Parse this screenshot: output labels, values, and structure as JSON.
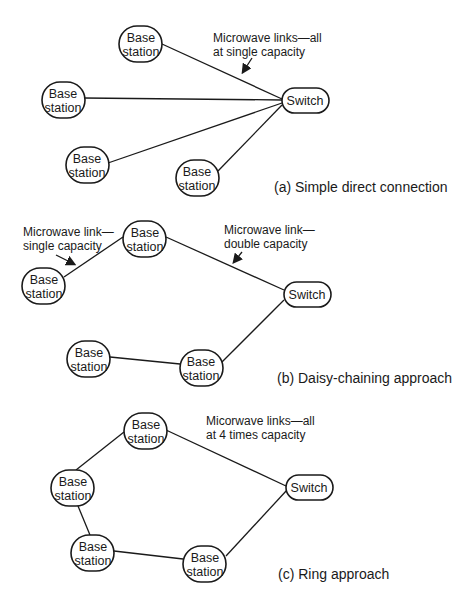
{
  "node_labels": {
    "base_line1": "Base",
    "base_line2": "station",
    "switch": "Switch"
  },
  "panels": [
    {
      "id": "a",
      "caption": "(a) Simple direct connection",
      "annotation": [
        "Microwave links—all",
        "at single capacity"
      ]
    },
    {
      "id": "b",
      "caption": "(b) Daisy-chaining approach",
      "annotation_left": [
        "Microwave link—",
        "single capacity"
      ],
      "annotation_right": [
        "Microwave link—",
        "double capacity"
      ]
    },
    {
      "id": "c",
      "caption": "(c) Ring approach",
      "annotation": [
        "Micorwave links—all",
        "at 4 times capacity"
      ]
    }
  ],
  "colors": {
    "stroke": "#1a1a1a",
    "background": "#ffffff"
  }
}
